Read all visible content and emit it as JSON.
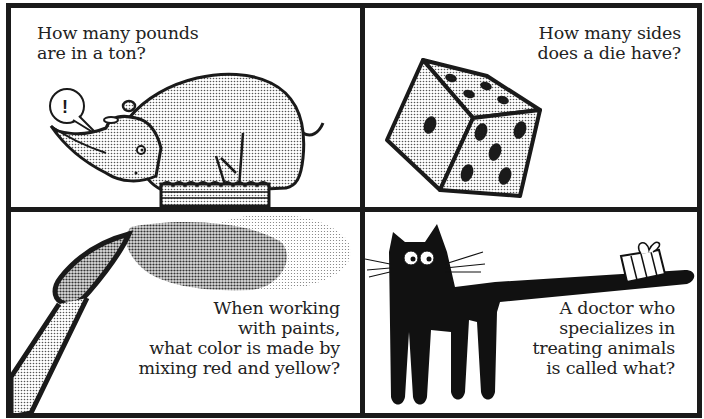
{
  "panels": [
    {
      "id": "top-left",
      "illustration": "rhino-icon",
      "speech_bubble": "!",
      "question_lines": [
        "How many pounds",
        "are in a ton?"
      ]
    },
    {
      "id": "top-right",
      "illustration": "die-icon",
      "question_lines": [
        "How many sides",
        "does a die have?"
      ]
    },
    {
      "id": "bottom-left",
      "illustration": "paintbrush-icon",
      "question_lines": [
        "When working",
        "with paints,",
        "what color is made by",
        "mixing red and yellow?"
      ]
    },
    {
      "id": "bottom-right",
      "illustration": "cat-icon",
      "question_lines": [
        "A doctor who",
        "specializes in",
        "treating animals",
        "is called what?"
      ]
    }
  ],
  "colors": {
    "ink": "#1a1a1a",
    "paper": "#ffffff",
    "halftone": "#bdbdbd",
    "halftone_dark": "#8f8f8f"
  }
}
